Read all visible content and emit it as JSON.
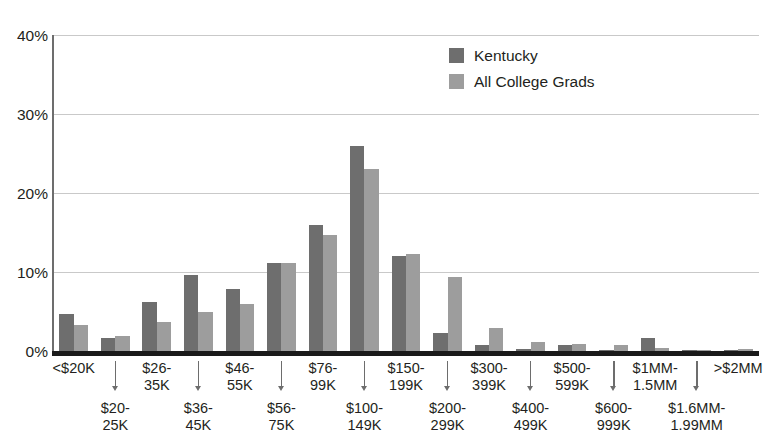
{
  "chart_data": {
    "type": "bar",
    "title": "",
    "subtitle": "",
    "xlabel": "",
    "ylabel": "",
    "ylim": [
      0,
      40
    ],
    "y_ticks": [
      "0%",
      "10%",
      "20%",
      "30%",
      "40%"
    ],
    "y_tick_values": [
      0,
      10,
      20,
      30,
      40
    ],
    "grid": true,
    "grid_axis": "y",
    "legend_position": "top-right",
    "categories": [
      "<$20K",
      "$20-\n25K",
      "$26-\n35K",
      "$36-\n45K",
      "$46-\n55K",
      "$56-\n75K",
      "$76-\n99K",
      "$100-\n149K",
      "$150-\n199K",
      "$200-\n299K",
      "$300-\n399K",
      "$400-\n499K",
      "$500-\n599K",
      "$600-\n999K",
      "$1MM-\n1.5MM",
      "$1.6MM-\n1.99MM",
      ">$2MM"
    ],
    "series": [
      {
        "name": "Kentucky",
        "color": "#6e6e6e",
        "values": [
          4.7,
          1.6,
          6.2,
          9.6,
          7.9,
          11.1,
          16.0,
          26.0,
          12.0,
          2.3,
          0.8,
          0.2,
          0.8,
          0.15,
          1.6,
          0.1,
          0.1
        ]
      },
      {
        "name": "All College Grads",
        "color": "#9d9d9d",
        "values": [
          3.3,
          1.9,
          3.7,
          5.0,
          6.0,
          11.2,
          14.7,
          23.0,
          12.3,
          9.4,
          2.9,
          1.2,
          0.9,
          0.8,
          0.4,
          0.15,
          0.2
        ]
      }
    ]
  },
  "legend": {
    "items": [
      {
        "label": "Kentucky",
        "color": "#6e6e6e"
      },
      {
        "label": "All College Grads",
        "color": "#9d9d9d"
      }
    ]
  },
  "y_axis": {
    "ticks": [
      "40%",
      "30%",
      "20%",
      "10%",
      "0%"
    ]
  },
  "x_axis": {
    "top_labels": [
      "<$20K",
      "$26-\n35K",
      "$46-\n55K",
      "$76-\n99K",
      "$150-\n199K",
      "$300-\n399K",
      "$500-\n599K",
      "$1MM-\n1.5MM",
      ">$2MM"
    ],
    "bottom_labels": [
      "$20-\n25K",
      "$36-\n45K",
      "$56-\n75K",
      "$100-\n149K",
      "$200-\n299K",
      "$400-\n499K",
      "$600-\n999K",
      "$1.6MM-\n1.99MM"
    ]
  }
}
